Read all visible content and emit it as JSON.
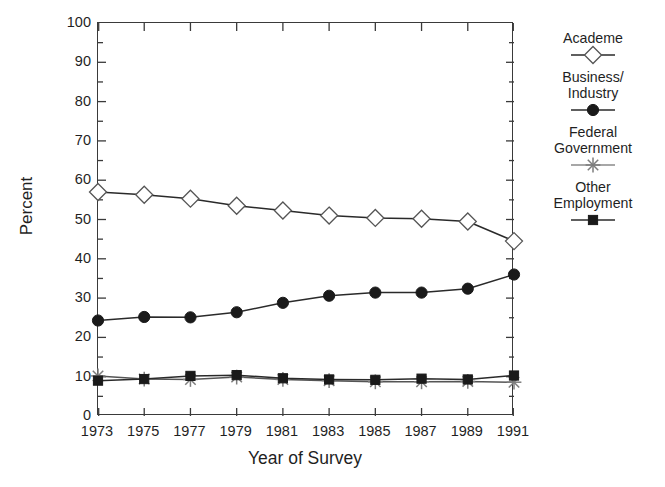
{
  "chart_data": {
    "type": "line",
    "title": "",
    "xlabel": "Year of Survey",
    "ylabel": "Percent",
    "x": [
      1973,
      1975,
      1977,
      1979,
      1981,
      1983,
      1985,
      1987,
      1989,
      1991
    ],
    "categories": [
      "1973",
      "1975",
      "1977",
      "1979",
      "1981",
      "1983",
      "1985",
      "1987",
      "1989",
      "1991"
    ],
    "xlim": [
      1973,
      1991
    ],
    "ylim": [
      0,
      100
    ],
    "yticks": [
      0,
      10,
      20,
      30,
      40,
      50,
      60,
      70,
      80,
      90,
      100
    ],
    "ytick_labels": [
      "0",
      "10",
      "20",
      "30",
      "40",
      "50",
      "60",
      "70",
      "80",
      "90",
      "100"
    ],
    "minor_yticks_interval": 5,
    "grid": false,
    "legend_position": "right",
    "series": [
      {
        "name": "Academe",
        "legend_label": "Academe",
        "marker": "open-diamond",
        "color": "#555555",
        "values": [
          57.0,
          56.3,
          55.3,
          53.5,
          52.3,
          51.0,
          50.4,
          50.2,
          49.5,
          44.5
        ]
      },
      {
        "name": "Business/Industry",
        "legend_label": "Business/\nIndustry",
        "marker": "filled-circle",
        "color": "#1a1a1a",
        "values": [
          24.3,
          25.2,
          25.1,
          26.4,
          28.8,
          30.6,
          31.4,
          31.4,
          32.4,
          36.0
        ]
      },
      {
        "name": "Federal Government",
        "legend_label": "Federal\nGovernment",
        "marker": "asterisk",
        "color": "#7d7d7d",
        "values": [
          10.2,
          9.4,
          9.3,
          9.9,
          9.3,
          9.0,
          8.7,
          8.7,
          8.8,
          8.6
        ]
      },
      {
        "name": "Other Employment",
        "legend_label": "Other\nEmployment",
        "marker": "filled-square",
        "color": "#1a1a1a",
        "values": [
          9.0,
          9.4,
          10.2,
          10.4,
          9.6,
          9.3,
          9.2,
          9.5,
          9.3,
          10.3
        ]
      }
    ]
  },
  "legend": {
    "entries": [
      {
        "label": "Academe",
        "marker": "open-diamond"
      },
      {
        "label": "Business/\nIndustry",
        "marker": "filled-circle"
      },
      {
        "label": "Federal\nGovernment",
        "marker": "asterisk"
      },
      {
        "label": "Other\nEmployment",
        "marker": "filled-square"
      }
    ]
  }
}
